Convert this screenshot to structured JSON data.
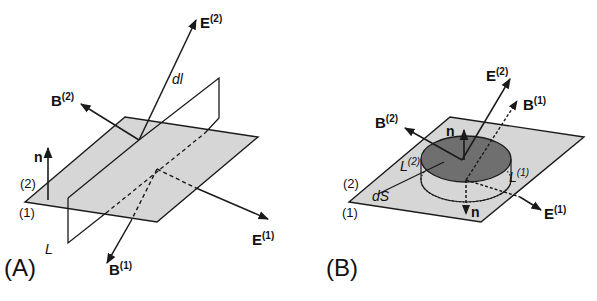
{
  "panels": {
    "A": {
      "label": "(A)",
      "vectors": {
        "E2": {
          "base": "E",
          "sup": "(2)"
        },
        "B2": {
          "base": "B",
          "sup": "(2)"
        },
        "E1": {
          "base": "E",
          "sup": "(1)"
        },
        "B1": {
          "base": "B",
          "sup": "(1)"
        },
        "n": "n"
      },
      "labels": {
        "dl": "dl",
        "L": "L",
        "medium2": "(2)",
        "medium1": "(1)"
      }
    },
    "B": {
      "label": "(B)",
      "vectors": {
        "E2": {
          "base": "E",
          "sup": "(2)"
        },
        "B1": {
          "base": "B",
          "sup": "(1)"
        },
        "B2": {
          "base": "B",
          "sup": "(2)"
        },
        "E1": {
          "base": "E",
          "sup": "(1)"
        },
        "n_up": "n",
        "n_down": "n"
      },
      "labels": {
        "L2": {
          "base": "L",
          "sup": "(2)"
        },
        "L1": {
          "base": "L",
          "sup": "(1)"
        },
        "dS": "dS",
        "medium2": "(2)",
        "medium1": "(1)"
      }
    }
  },
  "colors": {
    "plane_fill": "#d6d6d6",
    "disk_fill": "#6f6f6f",
    "line": "#1a1a1a"
  }
}
